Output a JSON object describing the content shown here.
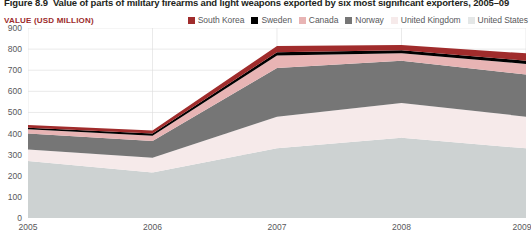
{
  "figure": {
    "number": "Figure 8.9",
    "title": "Value of parts of military firearms and light weapons exported by six most significant exporters, 2005–09",
    "axis_title": "VALUE (USD MILLION)"
  },
  "colors": {
    "south_korea": "#a02c2c",
    "sweden": "#000000",
    "canada": "#e8b4b4",
    "norway": "#767676",
    "united_kingdom": "#f6eaea",
    "united_states": "#cdd2d2",
    "label_red": "#9c2b2b",
    "text_gray": "#58585b",
    "grid": "#dcdcdc",
    "title_dark": "#231f20"
  },
  "legend": {
    "items": [
      {
        "label": "South Korea",
        "color": "#a02c2c"
      },
      {
        "label": "Sweden",
        "color": "#000000"
      },
      {
        "label": "Canada",
        "color": "#e8b4b4"
      },
      {
        "label": "Norway",
        "color": "#767676"
      },
      {
        "label": "United Kingdom",
        "color": "#f6eaea"
      },
      {
        "label": "United States",
        "color": "#cdd2d2"
      }
    ]
  },
  "chart_data": {
    "type": "area",
    "stacked": true,
    "title": "Value of parts of military firearms and light weapons exported by six most significant exporters, 2005–09",
    "xlabel": "",
    "ylabel": "VALUE (USD MILLION)",
    "x": [
      "2005",
      "2006",
      "2007",
      "2008",
      "2009"
    ],
    "xticklabels": [
      "2005",
      "2006",
      "2007",
      "2008",
      "2009"
    ],
    "yticklabels": [
      "0",
      "100",
      "200",
      "300",
      "400",
      "500",
      "600",
      "700",
      "800",
      "900"
    ],
    "ylim": [
      0,
      900
    ],
    "ytick_step": 100,
    "grid": true,
    "legend_position": "top-right",
    "stack_order_bottom_to_top": [
      "United States",
      "United Kingdom",
      "Norway",
      "Canada",
      "Sweden",
      "South Korea"
    ],
    "series": [
      {
        "name": "United States",
        "color": "#cdd2d2",
        "values": [
          270,
          215,
          330,
          380,
          330
        ]
      },
      {
        "name": "United Kingdom",
        "color": "#f6eaea",
        "values": [
          55,
          70,
          150,
          165,
          150
        ]
      },
      {
        "name": "Norway",
        "color": "#767676",
        "values": [
          75,
          80,
          230,
          200,
          200
        ]
      },
      {
        "name": "Canada",
        "color": "#e8b4b4",
        "values": [
          20,
          25,
          60,
          35,
          50
        ]
      },
      {
        "name": "Sweden",
        "color": "#000000",
        "values": [
          8,
          10,
          15,
          15,
          15
        ]
      },
      {
        "name": "South Korea",
        "color": "#a02c2c",
        "values": [
          12,
          15,
          30,
          25,
          35
        ]
      }
    ],
    "totals": [
      440,
      415,
      815,
      820,
      780
    ]
  }
}
